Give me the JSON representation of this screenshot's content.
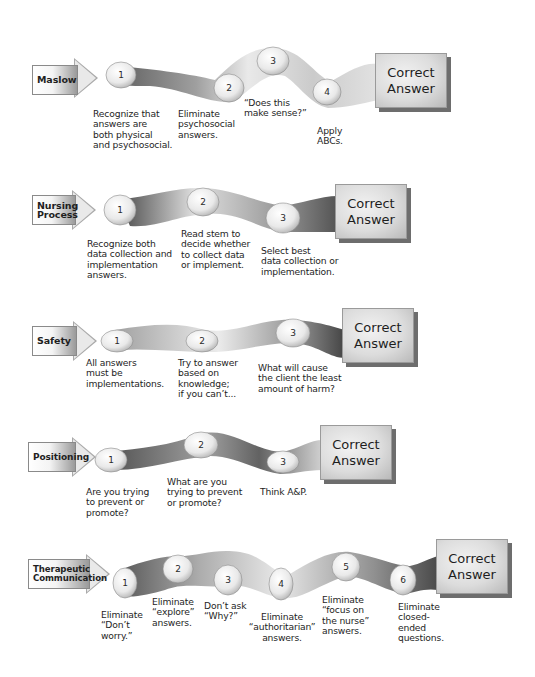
{
  "diagram": {
    "rows": [
      {
        "id": "maslow",
        "label": "Maslow",
        "end_label_line1": "Correct",
        "end_label_line2": "Answer",
        "steps": [
          {
            "number": "1",
            "text": "Recognize that\nanswers are\nboth physical\nand psychosocial."
          },
          {
            "number": "2",
            "text": "Eliminate\npsychosocial\nanswers."
          },
          {
            "number": "3",
            "text": "“Does this\nmake sense?”"
          },
          {
            "number": "4",
            "text": "Apply\nABCs."
          }
        ]
      },
      {
        "id": "nursing-process",
        "label": "Nursing\nProcess",
        "end_label_line1": "Correct",
        "end_label_line2": "Answer",
        "steps": [
          {
            "number": "1",
            "text": "Recognize both\ndata collection and\nimplementation\nanswers."
          },
          {
            "number": "2",
            "text": "Read stem to\ndecide whether\nto collect data\nor implement."
          },
          {
            "number": "3",
            "text": "Select best\ndata collection or\nimplementation."
          }
        ]
      },
      {
        "id": "safety",
        "label": "Safety",
        "end_label_line1": "Correct",
        "end_label_line2": "Answer",
        "steps": [
          {
            "number": "1",
            "text": "All answers\nmust be\nimplementations."
          },
          {
            "number": "2",
            "text": "Try to answer\nbased on\nknowledge;\nif you can’t..."
          },
          {
            "number": "3",
            "text": "What will cause\nthe client the least\namount of harm?"
          }
        ]
      },
      {
        "id": "positioning",
        "label": "Positioning",
        "end_label_line1": "Correct",
        "end_label_line2": "Answer",
        "steps": [
          {
            "number": "1",
            "text": "Are you trying\nto prevent or\npromote?"
          },
          {
            "number": "2",
            "text": "What are you\ntrying to prevent\nor promote?"
          },
          {
            "number": "3",
            "text": "Think A&P."
          }
        ]
      },
      {
        "id": "therapeutic-communication",
        "label": "Therapeutic\nCommunication",
        "end_label_line1": "Correct",
        "end_label_line2": "Answer",
        "steps": [
          {
            "number": "1",
            "text": "Eliminate\n“Don’t\nworry.”"
          },
          {
            "number": "2",
            "text": "Eliminate\n“explore”\nanswers."
          },
          {
            "number": "3",
            "text": "Don’t ask\n“Why?”"
          },
          {
            "number": "4",
            "text": "Eliminate\n“authoritarian”\nanswers."
          },
          {
            "number": "5",
            "text": "Eliminate\n“focus on\nthe nurse”\nanswers."
          },
          {
            "number": "6",
            "text": "Eliminate\nclosed-\nended\nquestions."
          }
        ]
      }
    ],
    "colors": {
      "ribbon_dark": "#4a4a4a",
      "ribbon_light": "#e6e6e6",
      "node_fill": "#f2f2f2",
      "box_shadow": "#6d6d6d",
      "text": "#1e1e1e"
    }
  }
}
